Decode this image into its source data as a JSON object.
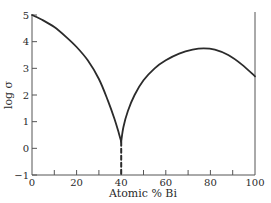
{
  "chart_data": {
    "type": "line",
    "title": "",
    "xlabel": "Atomic % Bi",
    "ylabel": "log σ",
    "xlim": [
      0,
      100
    ],
    "ylim": [
      -1,
      5
    ],
    "grid": false,
    "legend": null,
    "x_ticks": [
      0,
      20,
      40,
      60,
      80,
      100
    ],
    "x_minor_ticks": [
      10,
      30,
      50,
      70,
      90
    ],
    "y_ticks": [
      -1,
      0,
      1,
      2,
      3,
      4,
      5
    ],
    "series": [
      {
        "name": "conductivity",
        "style": "solid",
        "x": [
          0,
          5,
          10,
          15,
          20,
          25,
          30,
          34,
          37,
          39,
          40
        ],
        "values": [
          5.0,
          4.8,
          4.55,
          4.2,
          3.8,
          3.3,
          2.6,
          1.8,
          1.1,
          0.55,
          0.25
        ]
      },
      {
        "name": "conductivity-right",
        "style": "solid",
        "x": [
          40,
          41,
          43,
          46,
          50,
          55,
          60,
          66,
          72,
          77,
          82,
          88,
          94,
          100
        ],
        "values": [
          0.25,
          0.8,
          1.4,
          2.0,
          2.55,
          3.0,
          3.3,
          3.55,
          3.7,
          3.75,
          3.7,
          3.5,
          3.15,
          2.7
        ]
      },
      {
        "name": "extrapolation",
        "style": "dashed",
        "x": [
          40,
          40
        ],
        "values": [
          0.25,
          -1
        ]
      }
    ],
    "annotations": []
  },
  "axes": {
    "x_tick_labels": [
      "0",
      "20",
      "40",
      "60",
      "80",
      "100"
    ],
    "y_tick_labels": [
      "−1",
      "0",
      "1",
      "2",
      "3",
      "4",
      "5"
    ],
    "x_label": "Atomic % Bi",
    "y_label": "log σ"
  },
  "colors": {
    "curve": "#2b2b2b",
    "axis": "#555555",
    "background": "#ffffff"
  }
}
